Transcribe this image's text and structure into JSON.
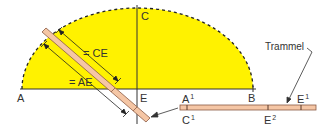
{
  "diagram": {
    "colors": {
      "ellipse_fill": "#fff200",
      "trammel_fill": "#f5c6a5",
      "trammel_stroke": "#8a5a44",
      "line": "#333333"
    },
    "points": {
      "A": "A",
      "B": "B",
      "C": "C",
      "E": "E"
    },
    "dimensions": {
      "ce": "= CE",
      "ae": "= AE"
    },
    "trammel": {
      "label": "Trammel",
      "marks": {
        "a1": "A",
        "a1_sup": "1",
        "c1": "C",
        "c1_sup": "1",
        "e1": "E",
        "e1_sup": "1",
        "e2": "E",
        "e2_sup": "2"
      }
    }
  }
}
